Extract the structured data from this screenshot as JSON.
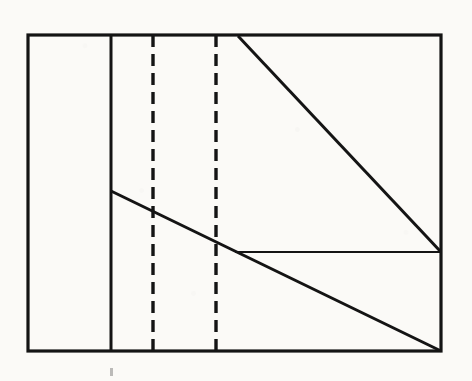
{
  "figure": {
    "title": "Technical line drawing — rectangular frame with partition, two dashed vertical guides, two diagonals and a horizontal segment",
    "medium": "scanned ink drawing on paper",
    "background_color": "#fbfaf7",
    "ink_color": "#141414",
    "canvas": {
      "width": 472,
      "height": 381
    },
    "frame": {
      "name": "outer-rectangle",
      "left": 28,
      "top": 35,
      "right": 441,
      "bottom": 351,
      "width": 413,
      "height": 316,
      "stroke_width": 3.2,
      "style": "solid"
    },
    "lines": [
      {
        "name": "vertical-partition",
        "style": "solid",
        "stroke_width": 3.0,
        "x1": 111,
        "y1": 35,
        "x2": 111,
        "y2": 351
      },
      {
        "name": "dashed-guide-left",
        "style": "dashed",
        "stroke_width": 3.4,
        "dash": "12 7",
        "x1": 153,
        "y1": 35,
        "x2": 153,
        "y2": 351
      },
      {
        "name": "dashed-guide-right",
        "style": "dashed",
        "stroke_width": 3.4,
        "dash": "12 7",
        "x1": 216,
        "y1": 35,
        "x2": 216,
        "y2": 351
      },
      {
        "name": "upper-diagonal",
        "style": "solid",
        "stroke_width": 3.0,
        "x1": 238,
        "y1": 36,
        "x2": 441,
        "y2": 252
      },
      {
        "name": "lower-diagonal",
        "style": "solid",
        "stroke_width": 3.0,
        "x1": 111,
        "y1": 191,
        "x2": 441,
        "y2": 351
      },
      {
        "name": "horizontal-segment",
        "style": "solid",
        "stroke_width": 2.2,
        "x1": 235,
        "y1": 252,
        "x2": 441,
        "y2": 252
      }
    ],
    "marks": [
      {
        "name": "faint-tick-mark",
        "x": 110,
        "y": 368,
        "width": 3,
        "height": 8,
        "opacity": 0.28
      }
    ]
  }
}
